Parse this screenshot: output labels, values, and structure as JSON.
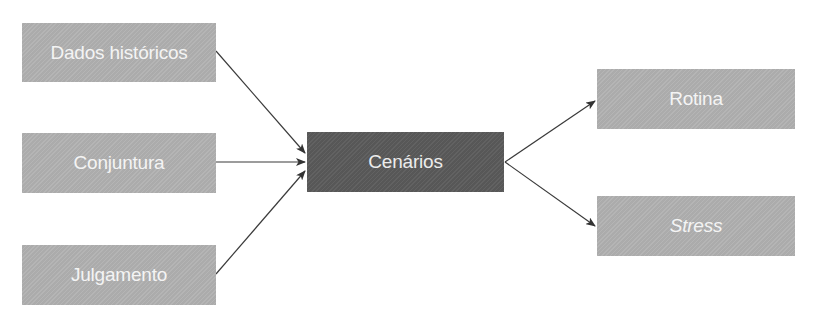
{
  "diagram": {
    "inputs": [
      {
        "id": "dados",
        "label": "Dados históricos"
      },
      {
        "id": "conjuntura",
        "label": "Conjuntura"
      },
      {
        "id": "julgamento",
        "label": "Julgamento"
      }
    ],
    "center": {
      "id": "cenarios",
      "label": "Cenários"
    },
    "outputs": [
      {
        "id": "rotina",
        "label": "Rotina",
        "italic": false
      },
      {
        "id": "stress",
        "label": "Stress",
        "italic": true
      }
    ],
    "edges": [
      {
        "from": "dados",
        "to": "cenarios"
      },
      {
        "from": "conjuntura",
        "to": "cenarios"
      },
      {
        "from": "julgamento",
        "to": "cenarios"
      },
      {
        "from": "cenarios",
        "to": "rotina"
      },
      {
        "from": "cenarios",
        "to": "stress"
      }
    ],
    "colors": {
      "input_box": "#b1b1b1",
      "center_box": "#5c5c5c",
      "output_box": "#b1b1b1",
      "text": "#f4f4f4",
      "arrow": "#333333"
    }
  }
}
